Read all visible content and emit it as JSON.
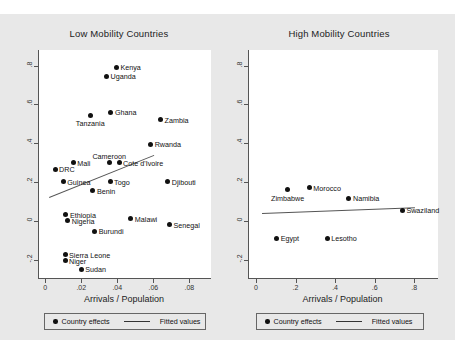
{
  "figure": {
    "background": "#e8e8e8",
    "xlabel": "Arrivals / Population",
    "legend": {
      "marker_label": "Country effects",
      "line_label": "Fitted values"
    }
  },
  "chart_data": [
    {
      "type": "scatter",
      "title": "Low Mobility Countries",
      "xlabel": "Arrivals / Population",
      "ylabel": "",
      "xlim": [
        -0.004,
        0.092
      ],
      "ylim": [
        -0.3,
        0.88
      ],
      "xticks": [
        0,
        0.02,
        0.04,
        0.06,
        0.08
      ],
      "xticklabels": [
        "0",
        ".02",
        ".04",
        ".06",
        ".08"
      ],
      "yticks": [
        0.8,
        0.6,
        0.4,
        0.2,
        0,
        -0.2
      ],
      "yticklabels": [
        ".8",
        ".6",
        ".4",
        ".2",
        "0",
        "-.2"
      ],
      "grid": false,
      "legend_position": "below",
      "points": [
        {
          "label": "Kenya",
          "x": 0.0395,
          "y": 0.79,
          "label_pos": "right"
        },
        {
          "label": "Uganda",
          "x": 0.034,
          "y": 0.745,
          "label_pos": "right"
        },
        {
          "label": "Ghana",
          "x": 0.0365,
          "y": 0.56,
          "label_pos": "right"
        },
        {
          "label": "Tanzania",
          "x": 0.025,
          "y": 0.545,
          "label_pos": "below"
        },
        {
          "label": "Zambia",
          "x": 0.064,
          "y": 0.52,
          "label_pos": "right"
        },
        {
          "label": "Rwanda",
          "x": 0.0585,
          "y": 0.395,
          "label_pos": "right"
        },
        {
          "label": "Cameroon",
          "x": 0.0355,
          "y": 0.3,
          "label_pos": "above"
        },
        {
          "label": "Cote d'Ivoire",
          "x": 0.041,
          "y": 0.3,
          "label_pos": "right"
        },
        {
          "label": "Mali",
          "x": 0.0155,
          "y": 0.3,
          "label_pos": "right"
        },
        {
          "label": "DRC",
          "x": 0.0055,
          "y": 0.265,
          "label_pos": "right"
        },
        {
          "label": "Guinea",
          "x": 0.01,
          "y": 0.2,
          "label_pos": "right"
        },
        {
          "label": "Togo",
          "x": 0.036,
          "y": 0.2,
          "label_pos": "right"
        },
        {
          "label": "Djibouti",
          "x": 0.068,
          "y": 0.2,
          "label_pos": "right"
        },
        {
          "label": "Benin",
          "x": 0.0265,
          "y": 0.155,
          "label_pos": "right"
        },
        {
          "label": "Ethiopia",
          "x": 0.0115,
          "y": 0.03,
          "label_pos": "right"
        },
        {
          "label": "Nigeria",
          "x": 0.0125,
          "y": 0.0,
          "label_pos": "right"
        },
        {
          "label": "Malawi",
          "x": 0.0475,
          "y": 0.01,
          "label_pos": "right"
        },
        {
          "label": "Senegal",
          "x": 0.069,
          "y": -0.02,
          "label_pos": "right"
        },
        {
          "label": "Burundi",
          "x": 0.0275,
          "y": -0.055,
          "label_pos": "right"
        },
        {
          "label": "Sierra Leone",
          "x": 0.011,
          "y": -0.175,
          "label_pos": "right"
        },
        {
          "label": "Niger",
          "x": 0.011,
          "y": -0.205,
          "label_pos": "right"
        },
        {
          "label": "Sudan",
          "x": 0.02,
          "y": -0.25,
          "label_pos": "right"
        }
      ],
      "fit_line": {
        "x0": 0.002,
        "y0": 0.122,
        "x1": 0.06,
        "y1": 0.338
      }
    },
    {
      "type": "scatter",
      "title": "High Mobility Countries",
      "xlabel": "Arrivals / Population",
      "ylabel": "",
      "xlim": [
        -0.04,
        0.92
      ],
      "ylim": [
        -0.3,
        0.88
      ],
      "xticks": [
        0,
        0.2,
        0.4,
        0.6,
        0.8
      ],
      "xticklabels": [
        "0",
        ".2",
        ".4",
        ".6",
        ".8"
      ],
      "yticks": [
        0.8,
        0.6,
        0.4,
        0.2,
        0,
        -0.2
      ],
      "yticklabels": [
        ".8",
        ".6",
        ".4",
        ".2",
        "0",
        "-.2"
      ],
      "grid": false,
      "legend_position": "below",
      "points": [
        {
          "label": "Morocco",
          "x": 0.27,
          "y": 0.17,
          "label_pos": "right"
        },
        {
          "label": "Zimbabwe",
          "x": 0.16,
          "y": 0.16,
          "label_pos": "below"
        },
        {
          "label": "Namibia",
          "x": 0.47,
          "y": 0.115,
          "label_pos": "right"
        },
        {
          "label": "Swaziland",
          "x": 0.74,
          "y": 0.055,
          "label_pos": "right"
        },
        {
          "label": "Egypt",
          "x": 0.105,
          "y": -0.09,
          "label_pos": "right"
        },
        {
          "label": "Lesotho",
          "x": 0.36,
          "y": -0.09,
          "label_pos": "right"
        }
      ],
      "fit_line": {
        "x0": 0.03,
        "y0": 0.042,
        "x1": 0.8,
        "y1": 0.072
      }
    }
  ]
}
